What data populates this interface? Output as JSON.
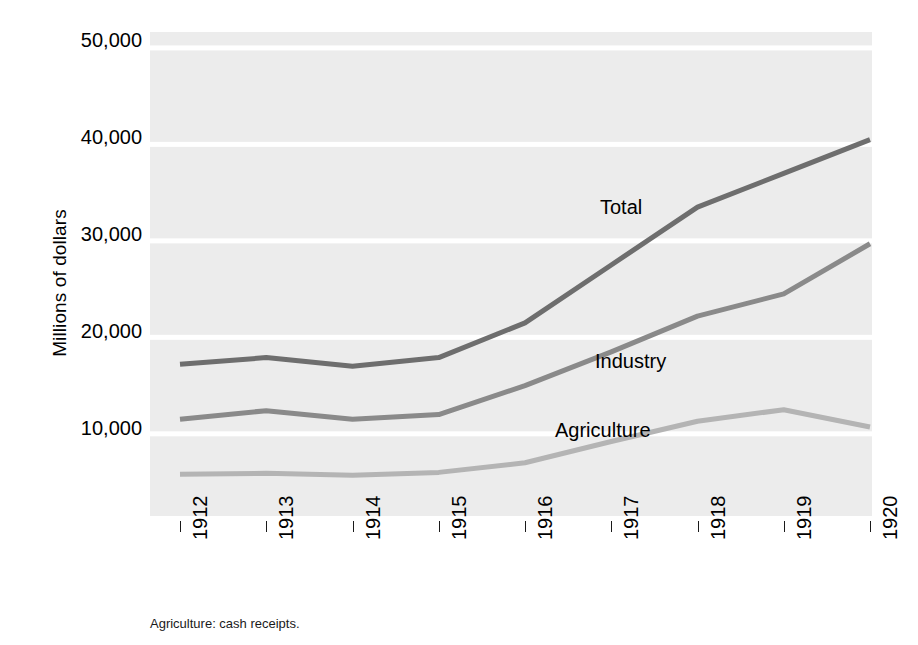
{
  "chart_data": {
    "type": "line",
    "title": "",
    "subtitle": "",
    "xlabel": "",
    "ylabel": "Millions of dollars",
    "categories": [
      "1912",
      "1913",
      "1914",
      "1915",
      "1916",
      "1917",
      "1918",
      "1919",
      "1920"
    ],
    "x": [
      1912,
      1913,
      1914,
      1915,
      1916,
      1917,
      1918,
      1919,
      1920
    ],
    "xlim": [
      1912,
      1920
    ],
    "ylim": [
      0,
      50000
    ],
    "grid": true,
    "grid_orientation": "horizontal",
    "legend_position": "inline-annotations",
    "y_ticks": [
      10000,
      20000,
      30000,
      40000,
      50000
    ],
    "y_tick_labels": [
      "10,000",
      "20,000",
      "30,000",
      "40,000",
      "50,000"
    ],
    "series": [
      {
        "name": "Total",
        "color": "#6e6e6e",
        "values": [
          17200,
          17900,
          17000,
          17900,
          21500,
          27500,
          33500,
          37000,
          40500
        ]
      },
      {
        "name": "Industry",
        "color": "#8a8a8a",
        "values": [
          11500,
          12400,
          11500,
          12000,
          15000,
          18500,
          22200,
          24500,
          29700
        ]
      },
      {
        "name": "Agriculture",
        "color": "#b4b4b4",
        "values": [
          5800,
          5900,
          5700,
          6000,
          7000,
          9200,
          11300,
          12500,
          10700
        ]
      }
    ],
    "annotations": [
      {
        "text": "Total",
        "x_px": 600,
        "y_px": 208
      },
      {
        "text": "Industry",
        "x_px": 595,
        "y_px": 362
      },
      {
        "text": "Agriculture",
        "x_px": 555,
        "y_px": 431
      }
    ],
    "footnote": "Agriculture: cash receipts."
  },
  "colors": {
    "plot_background": "#ececec",
    "page_background": "#ffffff",
    "gridline": "#ffffff",
    "text": "#000000",
    "tick_mark": "#1a1a1a"
  }
}
